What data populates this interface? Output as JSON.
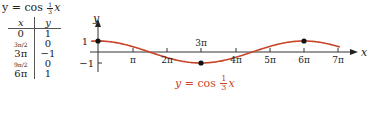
{
  "title": {
    "prefix": "y = cos",
    "frac_num": "1",
    "frac_den": "3",
    "suffix": "x"
  },
  "table": {
    "headers": [
      "x",
      "y"
    ],
    "rows": [
      {
        "x": "0",
        "y": "1"
      },
      {
        "x": "3π/2",
        "y": "0"
      },
      {
        "x": "3π",
        "y": "−1"
      },
      {
        "x": "9π/2",
        "y": "0"
      },
      {
        "x": "6π",
        "y": "1"
      }
    ]
  },
  "graph": {
    "y_axis_label": "y",
    "x_axis_label": "x",
    "y_tick_labels": [
      "1",
      "−1"
    ],
    "x_tick_labels": [
      "π",
      "2π",
      "3π",
      "4π",
      "5π",
      "6π",
      "7π"
    ],
    "curve_label": {
      "prefix": "y = cos",
      "frac_num": "1",
      "frac_den": "3",
      "suffix": "x"
    },
    "curve_color": "#c8452a",
    "key_points": [
      {
        "x": "0",
        "y": 1
      },
      {
        "x": "3π",
        "y": -1
      },
      {
        "x": "6π",
        "y": 1
      }
    ]
  },
  "chart_data": {
    "type": "line",
    "function": "y = cos(x/3)",
    "xlabel": "x",
    "ylabel": "y",
    "x_ticks": [
      "π",
      "2π",
      "3π",
      "4π",
      "5π",
      "6π",
      "7π"
    ],
    "y_ticks": [
      "1",
      "−1"
    ],
    "xlim": [
      "0",
      "7π"
    ],
    "ylim": [
      -1,
      1
    ],
    "series": [
      {
        "name": "y = cos (1/3) x",
        "x": [
          "0",
          "3π/2",
          "3π",
          "9π/2",
          "6π",
          "7π"
        ],
        "values": [
          1,
          0,
          -1,
          0,
          1,
          0.5
        ]
      }
    ],
    "marked_points": [
      {
        "x": "0",
        "y": 1
      },
      {
        "x": "3π",
        "y": -1
      },
      {
        "x": "6π",
        "y": 1
      }
    ],
    "grid": false
  }
}
